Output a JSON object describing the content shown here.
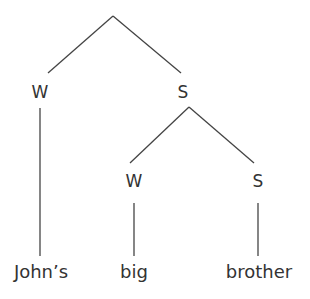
{
  "diagram": {
    "type": "metrical-tree",
    "nodes": {
      "root": {
        "label": ""
      },
      "w1": {
        "label": "W"
      },
      "s1": {
        "label": "S"
      },
      "w2": {
        "label": "W"
      },
      "s2": {
        "label": "S"
      }
    },
    "words": [
      "John’s",
      "big",
      "brother"
    ],
    "line_color": "#444444"
  }
}
